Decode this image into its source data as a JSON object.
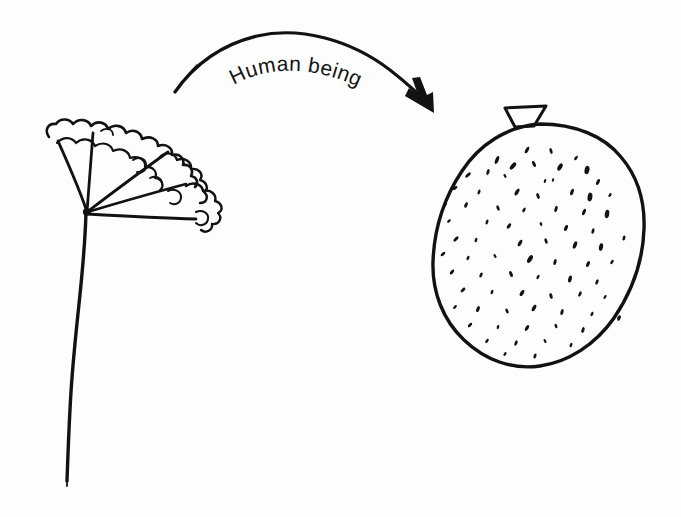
{
  "figure": {
    "kind": "hand-drawn-illustration",
    "background_color": "#fdfdfd",
    "ink_color": "#121212",
    "width": 681,
    "height": 517,
    "arrow": {
      "label": "Human being",
      "direction": "left-to-right",
      "style": "curved-arc-with-arrowhead",
      "start_point": "175,92",
      "end_point": "432,112"
    },
    "left_subject": {
      "name": "plant-with-fan-leaf",
      "description": "hand-drawn plant: long slightly wavy vertical stem with a fan of radiating ribs ending in wavy cloud-like lobed leaf margins",
      "rib_count": 5
    },
    "right_subject": {
      "name": "speckled-round-fruit",
      "description": "hand-drawn round fruit with a small trapezoidal calyx on top and many small dark speckles across its surface",
      "speckle_count": 78,
      "calyx_shape": "trapezoid"
    }
  },
  "labels": {
    "arrow_text": "Human being"
  },
  "colors": {
    "ink": "#121212",
    "paper": "#fdfdfd"
  }
}
